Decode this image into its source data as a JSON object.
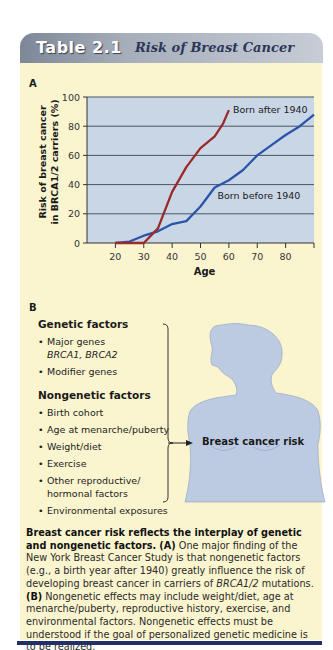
{
  "header": {
    "table_number": "Table 2.1",
    "title": "Risk of Breast Cancer"
  },
  "panel_a": {
    "label": "A"
  },
  "chart_data": {
    "type": "line",
    "title": "",
    "xlabel": "Age",
    "ylabel_line1": "Risk of breast cancer",
    "ylabel_line2": "in BRCA1/2 carriers (%)",
    "xlim": [
      10,
      90
    ],
    "ylim": [
      0,
      100
    ],
    "xticks": [
      20,
      30,
      40,
      50,
      60,
      70,
      80
    ],
    "yticks": [
      0,
      20,
      40,
      60,
      80,
      100
    ],
    "grid": "horizontal",
    "colors": {
      "plot_bg": "#c9d6e6",
      "after": "#9b2a2a",
      "before": "#2a55a8"
    },
    "series": [
      {
        "name": "Born after 1940",
        "x": [
          20,
          30,
          35,
          40,
          45,
          50,
          55,
          58,
          60
        ],
        "y": [
          0,
          0,
          10,
          35,
          52,
          65,
          73,
          82,
          91
        ]
      },
      {
        "name": "Born before 1940",
        "x": [
          20,
          25,
          30,
          35,
          40,
          45,
          50,
          55,
          60,
          65,
          70,
          75,
          80,
          85,
          90
        ],
        "y": [
          0,
          1,
          5,
          8,
          13,
          15,
          25,
          38,
          43,
          50,
          60,
          67,
          74,
          80,
          88
        ]
      }
    ]
  },
  "panel_b": {
    "label": "B",
    "genetic_heading": "Genetic factors",
    "genetic_items": [
      {
        "text": "Major genes",
        "sub": "BRCA1, BRCA2"
      },
      {
        "text": "Modifier genes",
        "sub": ""
      }
    ],
    "nongenetic_heading": "Nongenetic factors",
    "nongenetic_items": [
      "Birth cohort",
      "Age at menarche/puberty",
      "Weight/diet",
      "Exercise",
      "Other reproductive/ hormonal factors",
      "Environmental exposures"
    ],
    "outcome_label": "Breast cancer risk"
  },
  "caption": {
    "bold_lead": "Breast cancer risk reflects the interplay of genetic and nongenetic factors.",
    "a_marker": "(A)",
    "a_text_1": "One major finding of the New York Breast Cancer Study is that nongenetic factors (e.g., a birth year after 1940) greatly influence the risk of developing breast cancer in carriers of",
    "a_gene": "BRCA1/2",
    "a_text_2": "mutations.",
    "b_marker": "(B)",
    "b_text": "Nongenetic effects may include weight/diet, age at menarche/puberty, reproductive history, exercise, and environmental factors. Nongenetic effects must be understood if the goal of personalized genetic medicine is to be realized."
  }
}
